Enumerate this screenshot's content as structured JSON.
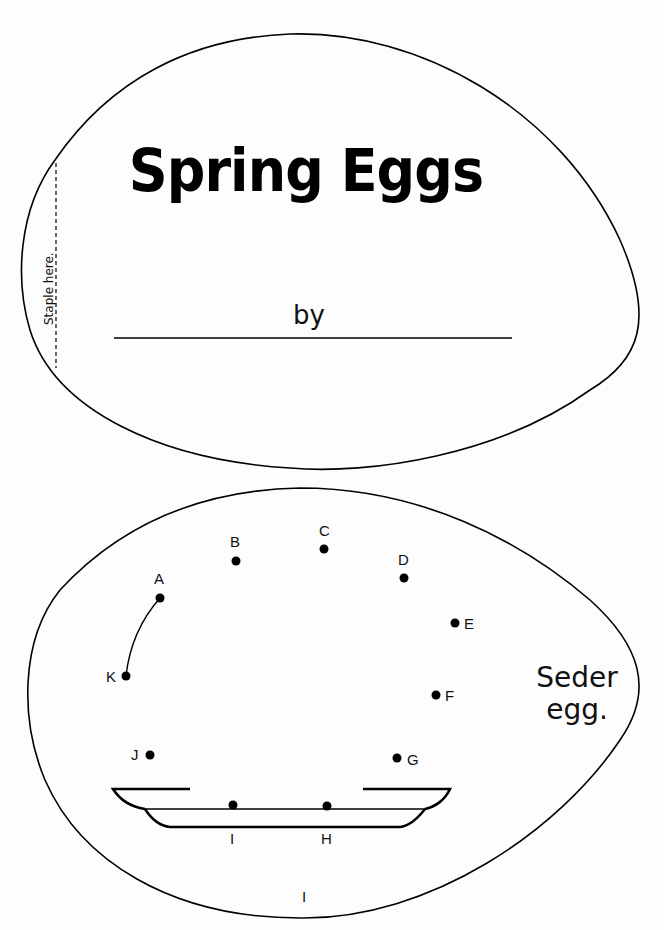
{
  "cover": {
    "title": "Spring Eggs",
    "by_label": "by",
    "staple_label": "Staple here.",
    "name_line_value": ""
  },
  "activity": {
    "caption": "Seder egg.",
    "page_number": "I",
    "dots": [
      {
        "label": "A",
        "x": 160,
        "y": 598
      },
      {
        "label": "B",
        "x": 236,
        "y": 561
      },
      {
        "label": "C",
        "x": 324,
        "y": 549
      },
      {
        "label": "D",
        "x": 404,
        "y": 578
      },
      {
        "label": "E",
        "x": 455,
        "y": 623
      },
      {
        "label": "F",
        "x": 436,
        "y": 695
      },
      {
        "label": "G",
        "x": 397,
        "y": 758
      },
      {
        "label": "H",
        "x": 327,
        "y": 806
      },
      {
        "label": "I",
        "x": 233,
        "y": 805
      },
      {
        "label": "J",
        "x": 150,
        "y": 755
      },
      {
        "label": "K",
        "x": 126,
        "y": 676
      }
    ]
  },
  "colors": {
    "ink": "#000000",
    "paper": "#fdfdfd"
  }
}
